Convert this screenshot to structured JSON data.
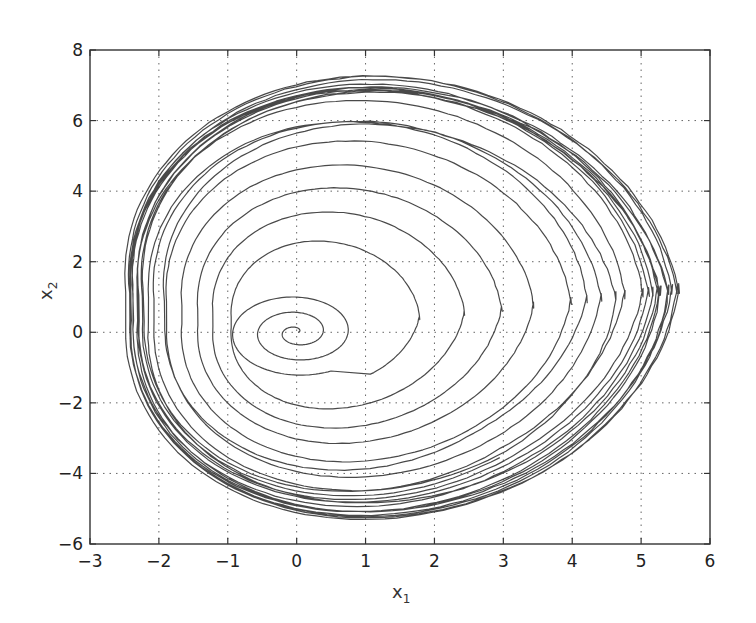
{
  "chart_data": {
    "type": "line",
    "title": "",
    "xlabel": "x1",
    "ylabel": "x2",
    "xlabel_display": {
      "base": "x",
      "sub": "1"
    },
    "ylabel_display": {
      "base": "x",
      "sub": "2"
    },
    "xlim": [
      -3,
      6
    ],
    "ylim": [
      -6,
      8
    ],
    "xticks": [
      -3,
      -2,
      -1,
      0,
      1,
      2,
      3,
      4,
      5,
      6
    ],
    "yticks": [
      -6,
      -4,
      -2,
      0,
      2,
      4,
      6,
      8
    ],
    "xtick_labels": [
      "−3",
      "−2",
      "−1",
      "0",
      "1",
      "2",
      "3",
      "4",
      "5",
      "6"
    ],
    "ytick_labels": [
      "−6",
      "−4",
      "−2",
      "0",
      "2",
      "4",
      "6",
      "8"
    ],
    "grid": true,
    "grid_style": "dotted",
    "legend": null,
    "series": [
      {
        "name": "trajectory",
        "color": "#3a3a3a",
        "start_point": [
          0.0,
          0.0
        ],
        "envelope": {
          "x_min": -2.5,
          "x_max": 5.6,
          "y_min": -5.3,
          "y_max": 7.4
        },
        "key_points": [
          {
            "x": 0.0,
            "y": 0.0,
            "note": "initial spiral center"
          },
          {
            "x": -0.9,
            "y": 0.0,
            "note": "first outer spiral turn left edge"
          },
          {
            "x": 2.0,
            "y": 0.0,
            "note": "inner loop right edge"
          },
          {
            "x": -2.5,
            "y": 0.0,
            "note": "attractor leftmost"
          },
          {
            "x": 5.6,
            "y": 0.5,
            "note": "attractor rightmost"
          },
          {
            "x": 1.3,
            "y": 7.4,
            "note": "attractor top"
          },
          {
            "x": 1.0,
            "y": -5.3,
            "note": "attractor bottom"
          },
          {
            "x": 4.5,
            "y": -3.9,
            "note": "bottom-right convergence of strands"
          }
        ]
      }
    ]
  },
  "colors": {
    "background": "#ffffff",
    "line": "#3a3a3a",
    "grid": "#666666",
    "frame": "#333333"
  }
}
